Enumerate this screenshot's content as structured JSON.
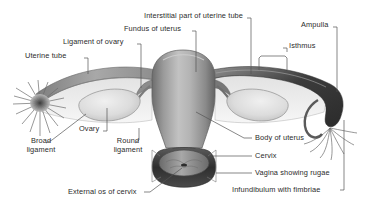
{
  "figure": {
    "background_color": "#ffffff",
    "text_color": "#2b2b2b",
    "leader_line_color": "#555555",
    "type": "anatomical-diagram"
  },
  "labels": {
    "interstitial_part": "Interstitial part of uterine tube",
    "fundus": "Fundus of uterus",
    "ligament_of_ovary": "Ligament of ovary",
    "uterine_tube": "Uterine tube",
    "ampulla": "Ampulla",
    "isthmus": "Isthmus",
    "ovary": "Ovary",
    "broad_ligament_l1": "Broad",
    "broad_ligament_l2": "ligament",
    "round_ligament_l1": "Round",
    "round_ligament_l2": "ligament",
    "body_of_uterus": "Body of uterus",
    "cervix": "Cervix",
    "vagina_rugae": "Vagina showing rugae",
    "external_os": "External os of cervix",
    "infundibulum": "Infundibulum with fimbriae"
  },
  "structures": {
    "uterus_body": {
      "name": "uterus-body",
      "fill_light": "#b9b9b9",
      "fill_dark": "#6f6f6f"
    },
    "ovary_left": {
      "name": "ovary-left",
      "fill": "#dcdcdc"
    },
    "ovary_right": {
      "name": "ovary-right",
      "fill": "#dcdcdc"
    },
    "broad_ligament": {
      "name": "broad-ligament",
      "fill": "#ebebeb"
    },
    "uterine_tube_band": {
      "name": "uterine-tube",
      "fill": "#9a9a9a"
    },
    "ampulla_right": {
      "name": "ampulla",
      "fill": "#4a4a4a"
    },
    "fimbriae_left": {
      "name": "fimbriae-left",
      "fill": "#5a5a5a"
    },
    "fimbriae_right": {
      "name": "fimbriae-right",
      "fill": "#5a5a5a"
    },
    "vagina": {
      "name": "vagina",
      "fill": "#3a3a3a"
    },
    "cervix_os": {
      "name": "cervix",
      "fill": "#9b9b9b"
    }
  }
}
